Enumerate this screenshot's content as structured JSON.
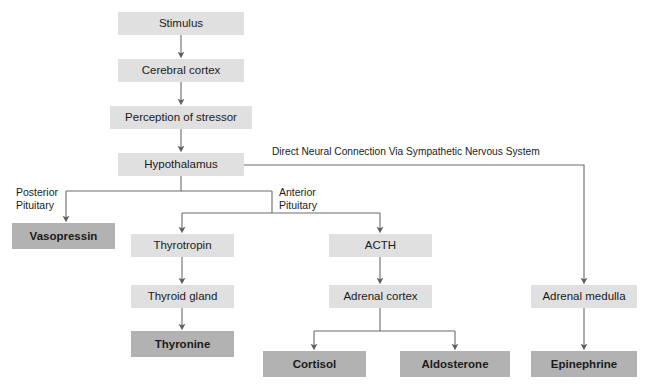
{
  "diagram": {
    "colors": {
      "light_box": "#e0e0e0",
      "dark_box": "#b2b2b2",
      "line": "#6b6b6b",
      "text": "#1b1b1b",
      "background": "#ffffff"
    },
    "nodes": [
      {
        "id": "stimulus",
        "label": "Stimulus",
        "style": "light",
        "x": 118,
        "y": 12,
        "w": 126,
        "h": 23
      },
      {
        "id": "cerebral-cortex",
        "label": "Cerebral cortex",
        "style": "light",
        "x": 118,
        "y": 59,
        "w": 126,
        "h": 23
      },
      {
        "id": "perception",
        "label": "Perception of stressor",
        "style": "light",
        "x": 110,
        "y": 106,
        "w": 142,
        "h": 23
      },
      {
        "id": "hypothalamus",
        "label": "Hypothalamus",
        "style": "light",
        "x": 118,
        "y": 153,
        "w": 126,
        "h": 23
      },
      {
        "id": "vasopressin",
        "label": "Vasopressin",
        "style": "dark",
        "x": 12,
        "y": 223,
        "w": 103,
        "h": 26
      },
      {
        "id": "thyrotropin",
        "label": "Thyrotropin",
        "style": "light",
        "x": 131,
        "y": 234,
        "w": 103,
        "h": 23
      },
      {
        "id": "thyroid-gland",
        "label": "Thyroid gland",
        "style": "light",
        "x": 131,
        "y": 285,
        "w": 103,
        "h": 23
      },
      {
        "id": "thyronine",
        "label": "Thyronine",
        "style": "dark",
        "x": 131,
        "y": 331,
        "w": 103,
        "h": 26
      },
      {
        "id": "acth",
        "label": "ACTH",
        "style": "light",
        "x": 329,
        "y": 234,
        "w": 103,
        "h": 23
      },
      {
        "id": "adrenal-cortex",
        "label": "Adrenal cortex",
        "style": "light",
        "x": 329,
        "y": 285,
        "w": 103,
        "h": 23
      },
      {
        "id": "cortisol",
        "label": "Cortisol",
        "style": "dark",
        "x": 263,
        "y": 351,
        "w": 103,
        "h": 26
      },
      {
        "id": "aldosterone",
        "label": "Aldosterone",
        "style": "dark",
        "x": 400,
        "y": 351,
        "w": 110,
        "h": 26
      },
      {
        "id": "adrenal-medulla",
        "label": "Adrenal medulla",
        "style": "light",
        "x": 531,
        "y": 285,
        "w": 106,
        "h": 23
      },
      {
        "id": "epinephrine",
        "label": "Epinephrine",
        "style": "dark",
        "x": 531,
        "y": 351,
        "w": 106,
        "h": 26
      }
    ],
    "edge_labels": [
      {
        "id": "direct-neural",
        "text": "Direct Neural Connection Via Sympathetic Nervous System",
        "x": 272,
        "y": 146,
        "wide": true
      },
      {
        "id": "posterior-pituitary",
        "text": "Posterior\nPituitary",
        "x": 16,
        "y": 186,
        "wide": false
      },
      {
        "id": "anterior-pituitary",
        "text": "Anterior\nPituitary",
        "x": 279,
        "y": 186,
        "wide": false
      }
    ]
  }
}
